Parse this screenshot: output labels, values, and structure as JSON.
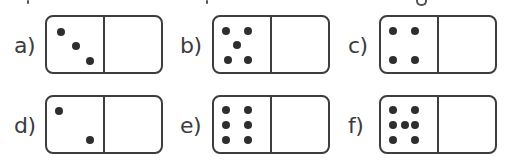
{
  "exercise": {
    "items": [
      {
        "label": "a)",
        "left_pips": 3,
        "right_pips": 0,
        "pips": [
          [
            25,
            28
          ],
          [
            52,
            53
          ],
          [
            77,
            80
          ]
        ]
      },
      {
        "label": "b)",
        "left_pips": 5,
        "right_pips": 0,
        "pips": [
          [
            22,
            25
          ],
          [
            61,
            25
          ],
          [
            41,
            51
          ],
          [
            25,
            79
          ],
          [
            61,
            79
          ]
        ]
      },
      {
        "label": "c)",
        "left_pips": 4,
        "right_pips": 0,
        "pips": [
          [
            22,
            25
          ],
          [
            61,
            25
          ],
          [
            22,
            79
          ],
          [
            61,
            79
          ]
        ]
      },
      {
        "label": "d)",
        "left_pips": 2,
        "right_pips": 0,
        "pips": [
          [
            22,
            25
          ],
          [
            77,
            79
          ]
        ]
      },
      {
        "label": "e)",
        "left_pips": 6,
        "right_pips": 0,
        "pips": [
          [
            22,
            23
          ],
          [
            61,
            23
          ],
          [
            22,
            51
          ],
          [
            61,
            51
          ],
          [
            22,
            79
          ],
          [
            61,
            79
          ]
        ]
      },
      {
        "label": "f)",
        "left_pips": 7,
        "right_pips": 0,
        "pips": [
          [
            22,
            23
          ],
          [
            61,
            23
          ],
          [
            22,
            51
          ],
          [
            42,
            51
          ],
          [
            61,
            51
          ],
          [
            22,
            79
          ],
          [
            61,
            79
          ]
        ]
      }
    ]
  },
  "colors": {
    "ink": "#3d3d3d",
    "pip": "#2e2e2e",
    "background": "#ffffff"
  }
}
